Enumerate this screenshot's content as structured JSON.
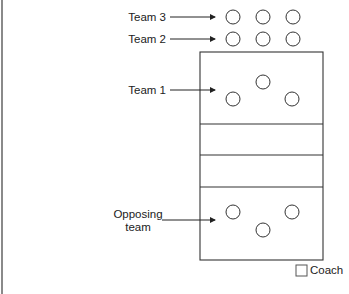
{
  "diagram": {
    "type": "volleyball-court-rotation-layout",
    "labels": {
      "team3": "Team 3",
      "team2": "Team 2",
      "team1": "Team 1",
      "opposing_line1": "Opposing",
      "opposing_line2": "team",
      "coach": "Coach"
    },
    "colors": {
      "stroke": "#333333",
      "background": "#ffffff",
      "border": "#8a8a8a"
    },
    "court": {
      "x": 200,
      "y": 52,
      "width": 123,
      "height": 208,
      "dividers_y": [
        124,
        155,
        187
      ]
    },
    "players": {
      "team3": [
        [
          233,
          17
        ],
        [
          263,
          17
        ],
        [
          293,
          17
        ]
      ],
      "team2": [
        [
          233,
          39
        ],
        [
          263,
          39
        ],
        [
          293,
          39
        ]
      ],
      "team1": [
        [
          263,
          78
        ],
        [
          233,
          99
        ],
        [
          292,
          99
        ]
      ],
      "opposing": [
        [
          233,
          212
        ],
        [
          292,
          212
        ],
        [
          263,
          230
        ]
      ]
    },
    "player_radius": 7
  }
}
